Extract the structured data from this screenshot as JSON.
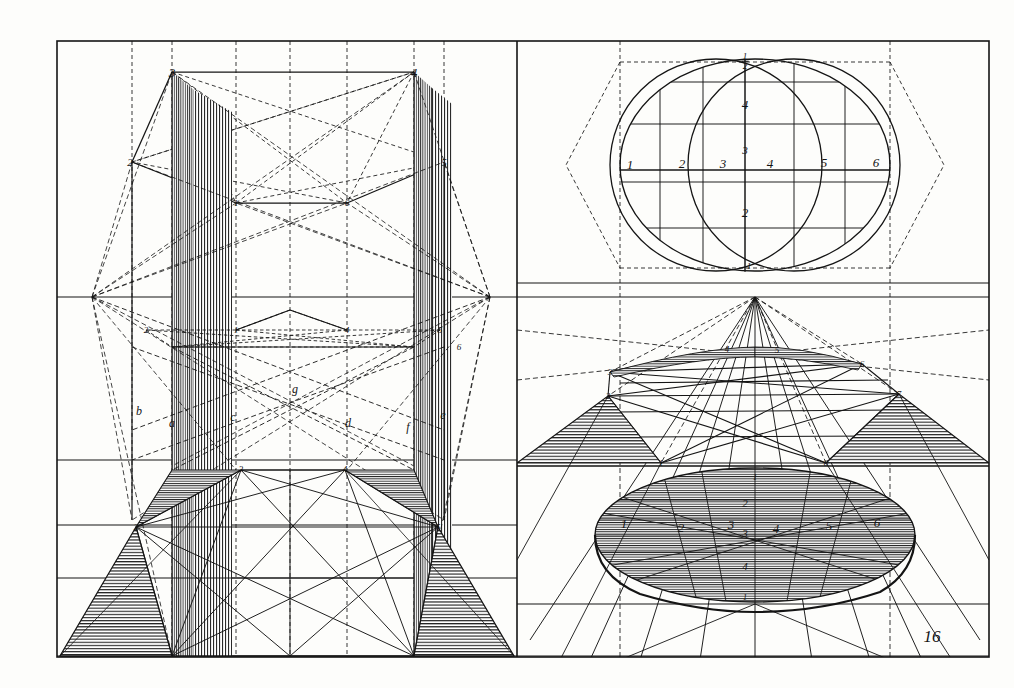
{
  "plate": {
    "number": "16",
    "medium": "engraving",
    "ink_color": "#141414",
    "paper_color": "#fdfdfb",
    "frame": {
      "left": 57,
      "top": 41,
      "right": 989,
      "bottom": 657,
      "divider_x": 517
    },
    "horizon_y": 297
  },
  "panels": {
    "top_left": {
      "name": "hexagonal-prism-elevation",
      "labels": [
        {
          "text": "3",
          "x": 172,
          "y": 72
        },
        {
          "text": "4",
          "x": 414,
          "y": 72
        },
        {
          "text": "2",
          "x": 130,
          "y": 162
        },
        {
          "text": "5",
          "x": 444,
          "y": 162
        },
        {
          "text": "1",
          "x": 236,
          "y": 203
        },
        {
          "text": "6",
          "x": 347,
          "y": 203
        }
      ]
    },
    "bottom_left": {
      "name": "hexagonal-prism-perspective",
      "labels": [
        {
          "text": "2",
          "x": 146,
          "y": 330
        },
        {
          "text": "1",
          "x": 236,
          "y": 330
        },
        {
          "text": "4",
          "x": 347,
          "y": 330
        },
        {
          "text": "5",
          "x": 440,
          "y": 330
        },
        {
          "text": "6",
          "x": 459,
          "y": 347
        },
        {
          "text": "b",
          "x": 139,
          "y": 411
        },
        {
          "text": "a",
          "x": 172,
          "y": 423
        },
        {
          "text": "c",
          "x": 233,
          "y": 417
        },
        {
          "text": "g",
          "x": 295,
          "y": 389
        },
        {
          "text": "d",
          "x": 348,
          "y": 423
        },
        {
          "text": "f",
          "x": 408,
          "y": 427
        },
        {
          "text": "e",
          "x": 443,
          "y": 415
        },
        {
          "text": "3",
          "x": 241,
          "y": 469
        },
        {
          "text": "4",
          "x": 345,
          "y": 469
        },
        {
          "text": "2",
          "x": 136,
          "y": 527
        },
        {
          "text": "5",
          "x": 438,
          "y": 527
        }
      ]
    },
    "top_right": {
      "name": "circle-plan-with-divisions",
      "labels": [
        {
          "text": "½",
          "x": 745,
          "y": 62,
          "fraction": {
            "numerator": "1",
            "denominator": "2"
          }
        },
        {
          "text": "4",
          "x": 745,
          "y": 104
        },
        {
          "text": "3",
          "x": 745,
          "y": 150
        },
        {
          "text": "1",
          "x": 630,
          "y": 164
        },
        {
          "text": "2",
          "x": 682,
          "y": 163
        },
        {
          "text": "3",
          "x": 723,
          "y": 163
        },
        {
          "text": "4",
          "x": 770,
          "y": 163
        },
        {
          "text": "5",
          "x": 824,
          "y": 162
        },
        {
          "text": "6",
          "x": 876,
          "y": 162
        },
        {
          "text": "2",
          "x": 745,
          "y": 212
        },
        {
          "text": "1",
          "x": 749,
          "y": 266
        }
      ]
    },
    "bottom_right": {
      "name": "circle-perspective-projection",
      "labels": [
        {
          "text": "3",
          "x": 610,
          "y": 372
        },
        {
          "text": "4",
          "x": 727,
          "y": 349
        },
        {
          "text": "5",
          "x": 777,
          "y": 350
        },
        {
          "text": "6",
          "x": 862,
          "y": 364
        },
        {
          "text": "2",
          "x": 608,
          "y": 396
        },
        {
          "text": "7",
          "x": 899,
          "y": 394
        },
        {
          "text": "1",
          "x": 661,
          "y": 463
        },
        {
          "text": "8",
          "x": 826,
          "y": 463
        },
        {
          "text": "1",
          "x": 755,
          "y": 477
        },
        {
          "text": "2",
          "x": 745,
          "y": 503
        },
        {
          "text": "1",
          "x": 624,
          "y": 523
        },
        {
          "text": "2",
          "x": 681,
          "y": 527
        },
        {
          "text": "3",
          "x": 731,
          "y": 524
        },
        {
          "text": "3",
          "x": 745,
          "y": 533
        },
        {
          "text": "4",
          "x": 776,
          "y": 528
        },
        {
          "text": "5",
          "x": 829,
          "y": 525
        },
        {
          "text": "6",
          "x": 877,
          "y": 522
        },
        {
          "text": "4",
          "x": 745,
          "y": 566
        },
        {
          "text": "1",
          "x": 745,
          "y": 597
        }
      ]
    }
  },
  "plate_number_label": {
    "text": "16",
    "x": 932,
    "y": 636
  }
}
